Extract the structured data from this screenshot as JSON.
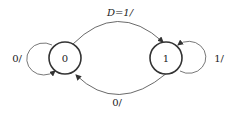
{
  "diagram": {
    "type": "state-machine",
    "states": [
      {
        "id": "s0",
        "label": "0"
      },
      {
        "id": "s1",
        "label": "1"
      }
    ],
    "transitions": [
      {
        "from": "s0",
        "to": "s1",
        "label": "D=1/"
      },
      {
        "from": "s1",
        "to": "s0",
        "label": "0/"
      },
      {
        "from": "s0",
        "to": "s0",
        "label": "0/"
      },
      {
        "from": "s1",
        "to": "s1",
        "label": "1/"
      }
    ],
    "colors": {
      "stroke": "#333333",
      "text": "#222222",
      "background": "#ffffff"
    }
  }
}
